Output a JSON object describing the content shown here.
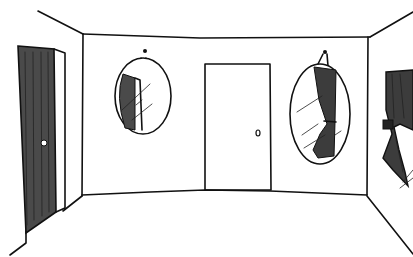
{
  "scene": {
    "description": "Hand-drawn ink sketch of an empty room viewed from inside",
    "colors": {
      "paper": "#ffffff",
      "ink": "#111111",
      "dark_fill": "#4a4a4a",
      "curtain_fill": "#3c3c3c"
    },
    "elements": [
      {
        "name": "left-wall",
        "label": "Left wall"
      },
      {
        "name": "back-wall",
        "label": "Back wall"
      },
      {
        "name": "right-wall",
        "label": "Right wall"
      },
      {
        "name": "floor",
        "label": "Floor"
      },
      {
        "name": "left-door",
        "label": "Dark open door on left wall"
      },
      {
        "name": "back-door",
        "label": "Closed door on back wall"
      },
      {
        "name": "left-mirror",
        "label": "Oval mirror reflecting dark door"
      },
      {
        "name": "right-mirror",
        "label": "Oval mirror reflecting curtain"
      },
      {
        "name": "window-curtain",
        "label": "Dark curtain tied back on right wall"
      }
    ]
  }
}
